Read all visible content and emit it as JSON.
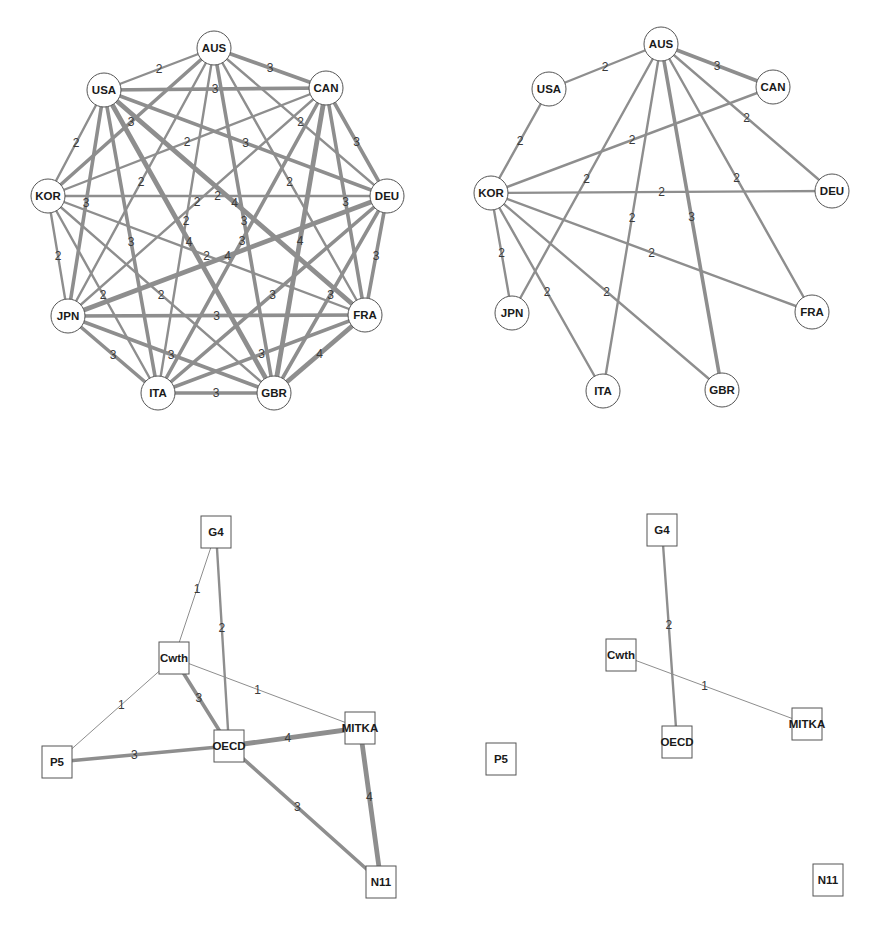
{
  "chart_data": [
    {
      "type": "network",
      "panel": "top-left",
      "node_shape": "circle",
      "nodes": [
        {
          "id": "AUS",
          "x": 214,
          "y": 48
        },
        {
          "id": "USA",
          "x": 104,
          "y": 90
        },
        {
          "id": "CAN",
          "x": 326,
          "y": 88
        },
        {
          "id": "KOR",
          "x": 48,
          "y": 196
        },
        {
          "id": "DEU",
          "x": 387,
          "y": 196
        },
        {
          "id": "JPN",
          "x": 68,
          "y": 316
        },
        {
          "id": "FRA",
          "x": 365,
          "y": 315
        },
        {
          "id": "ITA",
          "x": 158,
          "y": 393
        },
        {
          "id": "GBR",
          "x": 274,
          "y": 393
        }
      ],
      "edges": [
        {
          "source": "AUS",
          "target": "USA",
          "weight": 2
        },
        {
          "source": "AUS",
          "target": "CAN",
          "weight": 3
        },
        {
          "source": "AUS",
          "target": "KOR",
          "weight": 3
        },
        {
          "source": "AUS",
          "target": "DEU",
          "weight": 2
        },
        {
          "source": "AUS",
          "target": "JPN",
          "weight": 2
        },
        {
          "source": "AUS",
          "target": "FRA",
          "weight": 2
        },
        {
          "source": "AUS",
          "target": "ITA",
          "weight": 2
        },
        {
          "source": "AUS",
          "target": "GBR",
          "weight": 3
        },
        {
          "source": "USA",
          "target": "CAN",
          "weight": 3
        },
        {
          "source": "USA",
          "target": "KOR",
          "weight": 2
        },
        {
          "source": "USA",
          "target": "DEU",
          "weight": 3
        },
        {
          "source": "USA",
          "target": "JPN",
          "weight": 3
        },
        {
          "source": "USA",
          "target": "FRA",
          "weight": 4
        },
        {
          "source": "USA",
          "target": "ITA",
          "weight": 3
        },
        {
          "source": "USA",
          "target": "GBR",
          "weight": 4
        },
        {
          "source": "CAN",
          "target": "KOR",
          "weight": 2
        },
        {
          "source": "CAN",
          "target": "DEU",
          "weight": 3
        },
        {
          "source": "CAN",
          "target": "JPN",
          "weight": 2
        },
        {
          "source": "CAN",
          "target": "FRA",
          "weight": 3
        },
        {
          "source": "CAN",
          "target": "ITA",
          "weight": 3
        },
        {
          "source": "CAN",
          "target": "GBR",
          "weight": 4
        },
        {
          "source": "KOR",
          "target": "DEU",
          "weight": 2
        },
        {
          "source": "KOR",
          "target": "JPN",
          "weight": 2
        },
        {
          "source": "KOR",
          "target": "FRA",
          "weight": 2
        },
        {
          "source": "KOR",
          "target": "ITA",
          "weight": 2
        },
        {
          "source": "KOR",
          "target": "GBR",
          "weight": 2
        },
        {
          "source": "DEU",
          "target": "JPN",
          "weight": 4
        },
        {
          "source": "DEU",
          "target": "FRA",
          "weight": 3
        },
        {
          "source": "DEU",
          "target": "ITA",
          "weight": 3
        },
        {
          "source": "DEU",
          "target": "GBR",
          "weight": 3
        },
        {
          "source": "JPN",
          "target": "FRA",
          "weight": 3
        },
        {
          "source": "JPN",
          "target": "ITA",
          "weight": 3
        },
        {
          "source": "JPN",
          "target": "GBR",
          "weight": 3
        },
        {
          "source": "FRA",
          "target": "ITA",
          "weight": 3
        },
        {
          "source": "FRA",
          "target": "GBR",
          "weight": 4
        },
        {
          "source": "ITA",
          "target": "GBR",
          "weight": 3
        }
      ]
    },
    {
      "type": "network",
      "panel": "top-right",
      "node_shape": "circle",
      "nodes": [
        {
          "id": "AUS",
          "x": 661,
          "y": 44
        },
        {
          "id": "USA",
          "x": 549,
          "y": 89
        },
        {
          "id": "CAN",
          "x": 773,
          "y": 87
        },
        {
          "id": "KOR",
          "x": 491,
          "y": 193
        },
        {
          "id": "DEU",
          "x": 832,
          "y": 191
        },
        {
          "id": "JPN",
          "x": 512,
          "y": 313
        },
        {
          "id": "FRA",
          "x": 812,
          "y": 312
        },
        {
          "id": "ITA",
          "x": 603,
          "y": 391
        },
        {
          "id": "GBR",
          "x": 722,
          "y": 390
        }
      ],
      "edges": [
        {
          "source": "AUS",
          "target": "USA",
          "weight": 2
        },
        {
          "source": "AUS",
          "target": "CAN",
          "weight": 3
        },
        {
          "source": "AUS",
          "target": "DEU",
          "weight": 2
        },
        {
          "source": "AUS",
          "target": "JPN",
          "weight": 2
        },
        {
          "source": "AUS",
          "target": "ITA",
          "weight": 2
        },
        {
          "source": "AUS",
          "target": "GBR",
          "weight": 3
        },
        {
          "source": "AUS",
          "target": "FRA",
          "weight": 2
        },
        {
          "source": "USA",
          "target": "KOR",
          "weight": 2
        },
        {
          "source": "CAN",
          "target": "KOR",
          "weight": 2
        },
        {
          "source": "KOR",
          "target": "DEU",
          "weight": 2
        },
        {
          "source": "KOR",
          "target": "JPN",
          "weight": 2
        },
        {
          "source": "KOR",
          "target": "ITA",
          "weight": 2
        },
        {
          "source": "KOR",
          "target": "GBR",
          "weight": 2
        },
        {
          "source": "KOR",
          "target": "FRA",
          "weight": 2
        }
      ]
    },
    {
      "type": "network",
      "panel": "bottom-left",
      "node_shape": "square",
      "nodes": [
        {
          "id": "G4",
          "x": 216,
          "y": 532
        },
        {
          "id": "Cwth",
          "x": 174,
          "y": 658
        },
        {
          "id": "P5",
          "x": 57,
          "y": 762
        },
        {
          "id": "OECD",
          "x": 229,
          "y": 746
        },
        {
          "id": "MITKA",
          "x": 360,
          "y": 728
        },
        {
          "id": "N11",
          "x": 381,
          "y": 882
        }
      ],
      "edges": [
        {
          "source": "G4",
          "target": "Cwth",
          "weight": 1
        },
        {
          "source": "G4",
          "target": "OECD",
          "weight": 2
        },
        {
          "source": "Cwth",
          "target": "P5",
          "weight": 1
        },
        {
          "source": "Cwth",
          "target": "OECD",
          "weight": 3
        },
        {
          "source": "Cwth",
          "target": "MITKA",
          "weight": 1
        },
        {
          "source": "P5",
          "target": "OECD",
          "weight": 3
        },
        {
          "source": "OECD",
          "target": "MITKA",
          "weight": 4
        },
        {
          "source": "OECD",
          "target": "N11",
          "weight": 3
        },
        {
          "source": "MITKA",
          "target": "N11",
          "weight": 4
        }
      ]
    },
    {
      "type": "network",
      "panel": "bottom-right",
      "node_shape": "square",
      "nodes": [
        {
          "id": "G4",
          "x": 662,
          "y": 530
        },
        {
          "id": "Cwth",
          "x": 621,
          "y": 655
        },
        {
          "id": "MITKA",
          "x": 807,
          "y": 724
        },
        {
          "id": "OECD",
          "x": 677,
          "y": 742
        },
        {
          "id": "P5",
          "x": 501,
          "y": 759
        },
        {
          "id": "N11",
          "x": 828,
          "y": 880
        }
      ],
      "edges": [
        {
          "source": "G4",
          "target": "OECD",
          "weight": 2
        },
        {
          "source": "Cwth",
          "target": "MITKA",
          "weight": 1
        }
      ]
    }
  ],
  "style": {
    "edge_color": "#8e8e8e",
    "node_stroke": "#555555",
    "label_color": "#1a1a1a",
    "edge_label_color": "#3a3a3a"
  }
}
